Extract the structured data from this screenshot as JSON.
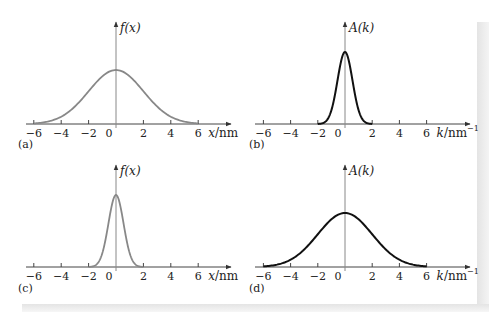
{
  "figure": {
    "panels": [
      {
        "id": "a",
        "label": "(a)",
        "y_axis_label": "f(x)",
        "x_axis_label": "x/nm",
        "ticks": [
          "−6",
          "−4",
          "−2",
          "0",
          "2",
          "4",
          "6"
        ],
        "curve_color": "#888888",
        "curve": "wide gaussian"
      },
      {
        "id": "b",
        "label": "(b)",
        "y_axis_label": "A(k)",
        "x_axis_label": "k/nm",
        "x_axis_exponent": "−1",
        "ticks": [
          "−6",
          "−4",
          "−2",
          "0",
          "2",
          "4",
          "6"
        ],
        "curve_color": "#111111",
        "curve": "narrow gaussian"
      },
      {
        "id": "c",
        "label": "(c)",
        "y_axis_label": "f(x)",
        "x_axis_label": "x/nm",
        "ticks": [
          "−6",
          "−4",
          "−2",
          "0",
          "2",
          "4",
          "6"
        ],
        "curve_color": "#888888",
        "curve": "narrow gaussian"
      },
      {
        "id": "d",
        "label": "(d)",
        "y_axis_label": "A(k)",
        "x_axis_label": "k/nm",
        "x_axis_exponent": "−1",
        "ticks": [
          "−6",
          "−4",
          "−2",
          "0",
          "2",
          "4",
          "6"
        ],
        "curve_color": "#111111",
        "curve": "wide gaussian"
      }
    ]
  },
  "chart_data": [
    {
      "type": "line",
      "title": "(a)",
      "xlabel": "x/nm",
      "ylabel": "f(x)",
      "x_ticks": [
        -6,
        -4,
        -2,
        0,
        2,
        4,
        6
      ],
      "xlim": [
        -6,
        6
      ],
      "description": "Wide Gaussian centered at 0, sigma ≈ 2 nm, peak ≈ 1 (relative), approaches zero at ±6",
      "x": [
        -6,
        -5,
        -4,
        -3,
        -2,
        -1,
        0,
        1,
        2,
        3,
        4,
        5,
        6
      ],
      "values": [
        0.01,
        0.04,
        0.14,
        0.32,
        0.61,
        0.88,
        1.0,
        0.88,
        0.61,
        0.32,
        0.14,
        0.04,
        0.01
      ],
      "grid": false
    },
    {
      "type": "line",
      "title": "(b)",
      "xlabel": "k/nm^-1",
      "ylabel": "A(k)",
      "x_ticks": [
        -6,
        -4,
        -2,
        0,
        2,
        4,
        6
      ],
      "xlim": [
        -6,
        6
      ],
      "description": "Narrow Gaussian centered at 0, sigma ≈ 0.5 nm^-1, peak ≈ 1.33 (relative to panel a), nonzero only between -2 and 2",
      "x": [
        -2,
        -1.5,
        -1,
        -0.5,
        0,
        0.5,
        1,
        1.5,
        2
      ],
      "values": [
        0.0,
        0.05,
        0.33,
        0.95,
        1.33,
        0.95,
        0.33,
        0.05,
        0.0
      ],
      "grid": false
    },
    {
      "type": "line",
      "title": "(c)",
      "xlabel": "x/nm",
      "ylabel": "f(x)",
      "x_ticks": [
        -6,
        -4,
        -2,
        0,
        2,
        4,
        6
      ],
      "xlim": [
        -6,
        6
      ],
      "description": "Narrow Gaussian centered at 0, sigma ≈ 0.5 nm, peak ≈ 1.33, nonzero only between -2 and 2",
      "x": [
        -2,
        -1.5,
        -1,
        -0.5,
        0,
        0.5,
        1,
        1.5,
        2
      ],
      "values": [
        0.0,
        0.05,
        0.33,
        0.95,
        1.33,
        0.95,
        0.33,
        0.05,
        0.0
      ],
      "grid": false
    },
    {
      "type": "line",
      "title": "(d)",
      "xlabel": "k/nm^-1",
      "ylabel": "A(k)",
      "x_ticks": [
        -6,
        -4,
        -2,
        0,
        2,
        4,
        6
      ],
      "xlim": [
        -6,
        6
      ],
      "description": "Wide Gaussian centered at 0, sigma ≈ 2 nm^-1, peak ≈ 1, approaches zero at ±6",
      "x": [
        -6,
        -5,
        -4,
        -3,
        -2,
        -1,
        0,
        1,
        2,
        3,
        4,
        5,
        6
      ],
      "values": [
        0.01,
        0.04,
        0.14,
        0.32,
        0.61,
        0.88,
        1.0,
        0.88,
        0.61,
        0.32,
        0.14,
        0.04,
        0.01
      ],
      "grid": false
    }
  ]
}
